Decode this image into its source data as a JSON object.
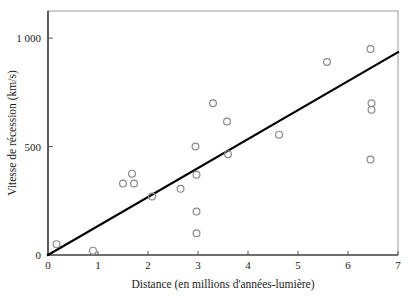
{
  "chart_data": {
    "type": "scatter",
    "title": "",
    "xlabel": "Distance (en millions d'années-lumière)",
    "ylabel": "Vitesse de récession (km/s)",
    "xlim": [
      0,
      7
    ],
    "ylim": [
      0,
      1125
    ],
    "xticks": [
      0,
      1,
      2,
      3,
      4,
      5,
      6,
      7
    ],
    "xtick_labels": [
      "0",
      "1",
      "2",
      "3",
      "4",
      "5",
      "6",
      "7"
    ],
    "yticks": [
      0,
      500,
      1000
    ],
    "ytick_labels": [
      "0",
      "500",
      "1 000"
    ],
    "grid": false,
    "legend": null,
    "marker_style": "open-circle",
    "marker_color": "#8a8a8a",
    "line_color": "#000000",
    "points": [
      {
        "x": 0.17,
        "y": 50
      },
      {
        "x": 0.9,
        "y": 20
      },
      {
        "x": 1.5,
        "y": 330
      },
      {
        "x": 1.68,
        "y": 375
      },
      {
        "x": 1.72,
        "y": 330
      },
      {
        "x": 2.08,
        "y": 270
      },
      {
        "x": 2.65,
        "y": 305
      },
      {
        "x": 2.95,
        "y": 500
      },
      {
        "x": 2.97,
        "y": 370
      },
      {
        "x": 2.97,
        "y": 200
      },
      {
        "x": 2.97,
        "y": 100
      },
      {
        "x": 3.3,
        "y": 700
      },
      {
        "x": 3.58,
        "y": 615
      },
      {
        "x": 3.6,
        "y": 465
      },
      {
        "x": 4.62,
        "y": 555
      },
      {
        "x": 5.58,
        "y": 890
      },
      {
        "x": 6.45,
        "y": 950
      },
      {
        "x": 6.47,
        "y": 700
      },
      {
        "x": 6.47,
        "y": 670
      },
      {
        "x": 6.45,
        "y": 440
      }
    ],
    "trend_line": {
      "x_start": 0,
      "y_start": 0,
      "x_end": 7,
      "y_end": 935,
      "slope": 133.6,
      "intercept": 0
    }
  }
}
